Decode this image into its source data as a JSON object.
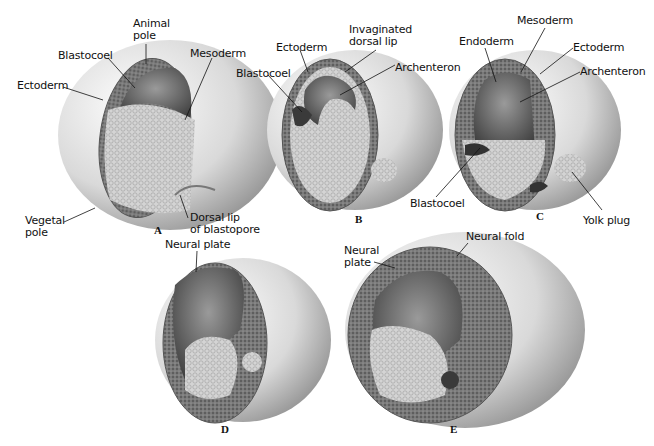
{
  "figure": {
    "panels": [
      {
        "id": "A",
        "letter": "A",
        "labels": [
          {
            "text": "Animal\npole",
            "x": 133,
            "y": 18
          },
          {
            "text": "Blastocoel",
            "x": 58,
            "y": 50
          },
          {
            "text": "Mesoderm",
            "x": 190,
            "y": 48
          },
          {
            "text": "Ectoderm",
            "x": 17,
            "y": 80
          },
          {
            "text": "Vegetal\npole",
            "x": 25,
            "y": 215
          },
          {
            "text": "Dorsal lip\nof blastopore",
            "x": 190,
            "y": 212
          }
        ]
      },
      {
        "id": "B",
        "letter": "B",
        "labels": [
          {
            "text": "Invaginated\ndorsal lip",
            "x": 349,
            "y": 24
          },
          {
            "text": "Ectoderm",
            "x": 276,
            "y": 42
          },
          {
            "text": "Archenteron",
            "x": 395,
            "y": 62
          },
          {
            "text": "Blastocoel",
            "x": 236,
            "y": 68
          }
        ]
      },
      {
        "id": "C",
        "letter": "C",
        "labels": [
          {
            "text": "Mesoderm",
            "x": 517,
            "y": 15
          },
          {
            "text": "Endoderm",
            "x": 459,
            "y": 36
          },
          {
            "text": "Ectoderm",
            "x": 573,
            "y": 42
          },
          {
            "text": "Archenteron",
            "x": 580,
            "y": 66
          },
          {
            "text": "Blastocoel",
            "x": 410,
            "y": 198
          },
          {
            "text": "Yolk plug",
            "x": 583,
            "y": 215
          }
        ]
      },
      {
        "id": "D",
        "letter": "D",
        "labels": [
          {
            "text": "Neural plate",
            "x": 165,
            "y": 239
          }
        ]
      },
      {
        "id": "E",
        "letter": "E",
        "labels": [
          {
            "text": "Neural fold",
            "x": 466,
            "y": 231
          },
          {
            "text": "Neural\nplate",
            "x": 344,
            "y": 245
          }
        ]
      }
    ]
  },
  "colors": {
    "ectoderm": "#6e6e6e",
    "mesoderm": "#4a4a4a",
    "yolk": "#d8d8d8",
    "shell_light": "#f2f2f2",
    "shell_dark": "#9a9a9a",
    "cavity": "#5a5a5a"
  }
}
